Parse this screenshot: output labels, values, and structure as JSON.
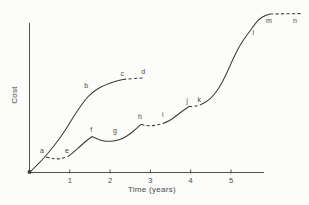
{
  "figure": {
    "background": "#fcfcfa",
    "ink_color": "#3e3c39",
    "text_color": "#4a4a4a"
  },
  "chart_data": {
    "type": "line",
    "title": "",
    "xlabel": "Time (years)",
    "ylabel": "Cost",
    "x_ticks": [
      "1",
      "2",
      "3",
      "4",
      "5"
    ],
    "grid": false,
    "legend": null,
    "y_axis_scale": "unlabeled (relative cost, 0 to 1 = flat top of final curve)",
    "xlim": [
      0,
      5.82
    ],
    "ylim": [
      0,
      1.05
    ],
    "layout": {
      "origin_px": [
        29.5,
        172.5
      ],
      "px_per_x_unit": 40.3,
      "px_per_y_unit": 158,
      "x_axis_end_px": 264,
      "y_axis_top_px": 23,
      "tick_top_px": 169.5,
      "tick_bottom_px": 173.5,
      "tick_label_baseline_px": 182.5,
      "origin_marker_px": [
        27.8,
        170.3,
        3.4,
        3.4
      ],
      "dash_pattern": "3.2 2.3"
    },
    "series": [
      {
        "name": "first-system-cost-curve",
        "segments": [
          {
            "style": "solid",
            "points": [
              [
                0,
                0
              ],
              [
                0.161,
                0.041
              ],
              [
                0.335,
                0.085
              ],
              [
                0.484,
                0.13
              ],
              [
                0.633,
                0.177
              ],
              [
                0.782,
                0.228
              ],
              [
                0.931,
                0.285
              ],
              [
                1.079,
                0.348
              ],
              [
                1.228,
                0.405
              ],
              [
                1.377,
                0.459
              ],
              [
                1.526,
                0.5
              ],
              [
                1.7,
                0.532
              ],
              [
                1.873,
                0.554
              ],
              [
                2.047,
                0.57
              ],
              [
                2.196,
                0.582
              ],
              [
                2.32,
                0.589
              ]
            ]
          },
          {
            "style": "dashed",
            "points": [
              [
                2.32,
                0.589
              ],
              [
                2.568,
                0.595
              ],
              [
                2.816,
                0.598
              ]
            ]
          }
        ]
      },
      {
        "name": "evolving-system-cost-curve",
        "segments": [
          {
            "style": "dashed",
            "points": [
              [
                0.409,
                0.098
              ],
              [
                0.533,
                0.09
              ],
              [
                0.682,
                0.085
              ],
              [
                0.831,
                0.09
              ],
              [
                0.955,
                0.101
              ]
            ]
          },
          {
            "style": "solid",
            "points": [
              [
                0.955,
                0.101
              ],
              [
                1.104,
                0.13
              ],
              [
                1.253,
                0.165
              ],
              [
                1.402,
                0.199
              ],
              [
                1.551,
                0.228
              ]
            ]
          },
          {
            "style": "solid",
            "points": [
              [
                1.551,
                0.228
              ],
              [
                1.724,
                0.206
              ],
              [
                1.923,
                0.196
              ],
              [
                2.122,
                0.199
              ],
              [
                2.32,
                0.215
              ],
              [
                2.494,
                0.244
              ],
              [
                2.643,
                0.275
              ],
              [
                2.767,
                0.304
              ]
            ]
          },
          {
            "style": "dashed",
            "points": [
              [
                2.767,
                0.304
              ],
              [
                2.94,
                0.294
              ],
              [
                3.139,
                0.298
              ],
              [
                3.313,
                0.31
              ]
            ]
          },
          {
            "style": "solid",
            "points": [
              [
                3.313,
                0.31
              ],
              [
                3.486,
                0.329
              ],
              [
                3.635,
                0.358
              ],
              [
                3.809,
                0.392
              ],
              [
                3.958,
                0.418
              ]
            ]
          },
          {
            "style": "dashed",
            "points": [
              [
                3.958,
                0.418
              ],
              [
                4.107,
                0.415
              ],
              [
                4.256,
                0.43
              ]
            ]
          },
          {
            "style": "solid",
            "points": [
              [
                4.256,
                0.43
              ],
              [
                4.405,
                0.449
              ],
              [
                4.553,
                0.484
              ],
              [
                4.702,
                0.535
              ],
              [
                4.826,
                0.592
              ],
              [
                4.95,
                0.661
              ],
              [
                5.074,
                0.731
              ],
              [
                5.198,
                0.794
              ],
              [
                5.322,
                0.845
              ],
              [
                5.471,
                0.896
              ],
              [
                5.595,
                0.94
              ],
              [
                5.719,
                0.975
              ],
              [
                5.843,
                0.994
              ],
              [
                5.967,
                1.003
              ]
            ]
          },
          {
            "style": "dashed",
            "points": [
              [
                5.967,
                1.003
              ],
              [
                6.762,
                1.006
              ]
            ]
          }
        ]
      }
    ],
    "point_labels": [
      {
        "text": "a",
        "x": 0.31,
        "y": 0.136
      },
      {
        "text": "b",
        "x": 1.41,
        "y": 0.547
      },
      {
        "text": "c",
        "x": 2.3,
        "y": 0.627
      },
      {
        "text": "d",
        "x": 2.82,
        "y": 0.636
      },
      {
        "text": "e",
        "x": 0.93,
        "y": 0.139
      },
      {
        "text": "f",
        "x": 1.53,
        "y": 0.272
      },
      {
        "text": "g",
        "x": 2.12,
        "y": 0.266
      },
      {
        "text": "h",
        "x": 2.74,
        "y": 0.351
      },
      {
        "text": "i",
        "x": 3.31,
        "y": 0.364
      },
      {
        "text": "j",
        "x": 3.91,
        "y": 0.453
      },
      {
        "text": "k",
        "x": 4.21,
        "y": 0.459
      },
      {
        "text": "l",
        "x": 5.55,
        "y": 0.883
      },
      {
        "text": "m",
        "x": 5.94,
        "y": 0.962
      },
      {
        "text": "n",
        "x": 6.59,
        "y": 0.962
      }
    ]
  }
}
